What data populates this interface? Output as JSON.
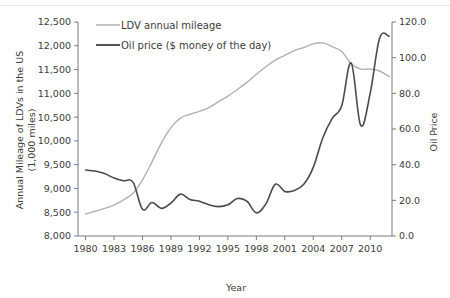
{
  "chart_data": {
    "type": "line",
    "title": "",
    "xlabel": "Year",
    "ylabel": "Annual Mileage of LDVs in the US (1,000 miles)",
    "y2label": "Oil Price",
    "xlim": [
      1979.2,
      2012.3
    ],
    "ylim": [
      8000,
      12500
    ],
    "y2lim": [
      0.0,
      120.0
    ],
    "grid": false,
    "legend_position": "top-center",
    "x_ticks": [
      1980,
      1983,
      1986,
      1989,
      1992,
      1995,
      1998,
      2001,
      2004,
      2007,
      2010
    ],
    "x_tick_labels": [
      "1980",
      "1983",
      "1986",
      "1989",
      "1992",
      "1995",
      "1998",
      "2001",
      "2004",
      "2007",
      "2010"
    ],
    "y_ticks": [
      8000,
      8500,
      9000,
      9500,
      10000,
      10500,
      11000,
      11500,
      12000,
      12500
    ],
    "y_tick_labels": [
      "8,000",
      "8,500",
      "9,000",
      "9,500",
      "10,000",
      "10,500",
      "11,000",
      "11,500",
      "12,000",
      "12,500"
    ],
    "y2_ticks": [
      0.0,
      20.0,
      40.0,
      60.0,
      80.0,
      100.0,
      120.0
    ],
    "y2_tick_labels": [
      "0.0",
      "20.0",
      "40.0",
      "60.0",
      "80.0",
      "100.0",
      "120.0"
    ],
    "x": [
      1980,
      1981,
      1982,
      1983,
      1984,
      1985,
      1986,
      1987,
      1988,
      1989,
      1990,
      1991,
      1992,
      1993,
      1994,
      1995,
      1996,
      1997,
      1998,
      1999,
      2000,
      2001,
      2002,
      2003,
      2004,
      2005,
      2006,
      2007,
      2008,
      2009,
      2010,
      2011,
      2012
    ],
    "series": [
      {
        "name": "LDV annual mileage",
        "axis": "left",
        "color": "#b0b0b0",
        "values": [
          8460,
          8520,
          8580,
          8650,
          8760,
          8900,
          9180,
          9560,
          9960,
          10280,
          10480,
          10560,
          10620,
          10700,
          10820,
          10940,
          11080,
          11230,
          11400,
          11560,
          11700,
          11800,
          11900,
          11960,
          12040,
          12060,
          11980,
          11880,
          11620,
          11510,
          11510,
          11470,
          11350
        ]
      },
      {
        "name": "Oil price ($ money of the day)",
        "axis": "right",
        "color": "#4a4a4a",
        "values": [
          37.0,
          36.4,
          35.0,
          32.5,
          31.0,
          30.2,
          15.0,
          18.8,
          15.5,
          18.5,
          23.5,
          20.5,
          19.5,
          17.5,
          16.5,
          17.5,
          21.0,
          19.5,
          13.0,
          18.0,
          29.0,
          25.0,
          25.5,
          29.0,
          38.5,
          55.0,
          66.0,
          73.0,
          97.0,
          62.0,
          80.0,
          111.0,
          112.0
        ]
      }
    ]
  },
  "legend": {
    "items": [
      {
        "label": "LDV annual mileage",
        "color": "#b0b0b0"
      },
      {
        "label": "Oil price ($ money of the day)",
        "color": "#4a4a4a"
      }
    ]
  },
  "axes": {
    "left_title": "Annual Mileage of LDVs in the US",
    "left_title_2": "(1,000 miles)",
    "right_title": "Oil Price",
    "bottom_title": "Year"
  }
}
